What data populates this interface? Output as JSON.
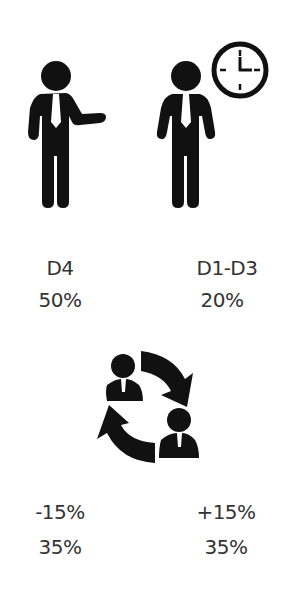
{
  "figures": [
    {
      "id": "d4",
      "icon": "presenting-person-icon",
      "label": "D4",
      "value": "50%"
    },
    {
      "id": "d1d3",
      "icon": "person-with-clock-icon",
      "label": "D1-D3",
      "value": "20%"
    }
  ],
  "exchange": {
    "icon": "people-exchange-icon",
    "left": {
      "change": "-15%",
      "value": "35%"
    },
    "right": {
      "change": "+15%",
      "value": "35%"
    }
  },
  "colors": {
    "icon": "#111111",
    "text": "#333333",
    "background": "#ffffff"
  }
}
